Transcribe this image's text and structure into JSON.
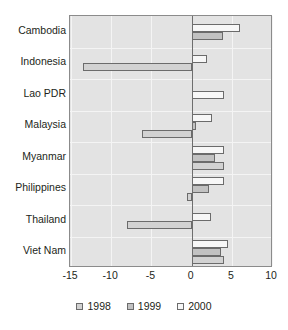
{
  "chart_data": {
    "type": "bar",
    "orientation": "horizontal",
    "title": "",
    "subtitle": "",
    "xlabel": "",
    "ylabel": "",
    "xlim": [
      -15,
      10
    ],
    "xticks": [
      -15,
      -10,
      -5,
      0,
      5,
      10
    ],
    "xtick_labels": [
      "-15",
      "-10",
      "-5",
      "0",
      "5",
      "10"
    ],
    "grid": true,
    "grid_axis": "x",
    "legend_position": "bottom",
    "zero_line": 0,
    "categories": [
      "Cambodia",
      "Indonesia",
      "Lao PDR",
      "Malaysia",
      "Myanmar",
      "Philippines",
      "Thailand",
      "Viet Nam"
    ],
    "series": [
      {
        "name": "1998",
        "color": "#d2d2d2",
        "values": [
          null,
          -13.5,
          null,
          -6.2,
          4.0,
          -0.6,
          -8.0,
          4.0
        ]
      },
      {
        "name": "1999",
        "color": "#c2c2c2",
        "values": [
          3.9,
          null,
          null,
          0.6,
          2.9,
          2.2,
          null,
          3.6
        ]
      },
      {
        "name": "2000",
        "color": "#f7f7f7",
        "values": [
          6.0,
          1.9,
          4.0,
          2.6,
          4.0,
          4.0,
          2.4,
          4.5
        ]
      }
    ]
  },
  "legend": {
    "items": [
      {
        "label": "1998",
        "series_key": "s1998"
      },
      {
        "label": "1999",
        "series_key": "s1999"
      },
      {
        "label": "2000",
        "series_key": "s2000"
      }
    ]
  },
  "colors": {
    "plot_background": "#e3e3e3",
    "plot_border": "#8b8b8b",
    "gridline": "#f4f4f4",
    "zero_line": "#6e6e6e",
    "bar_border": "#6b6b6b",
    "text": "#231f20"
  }
}
